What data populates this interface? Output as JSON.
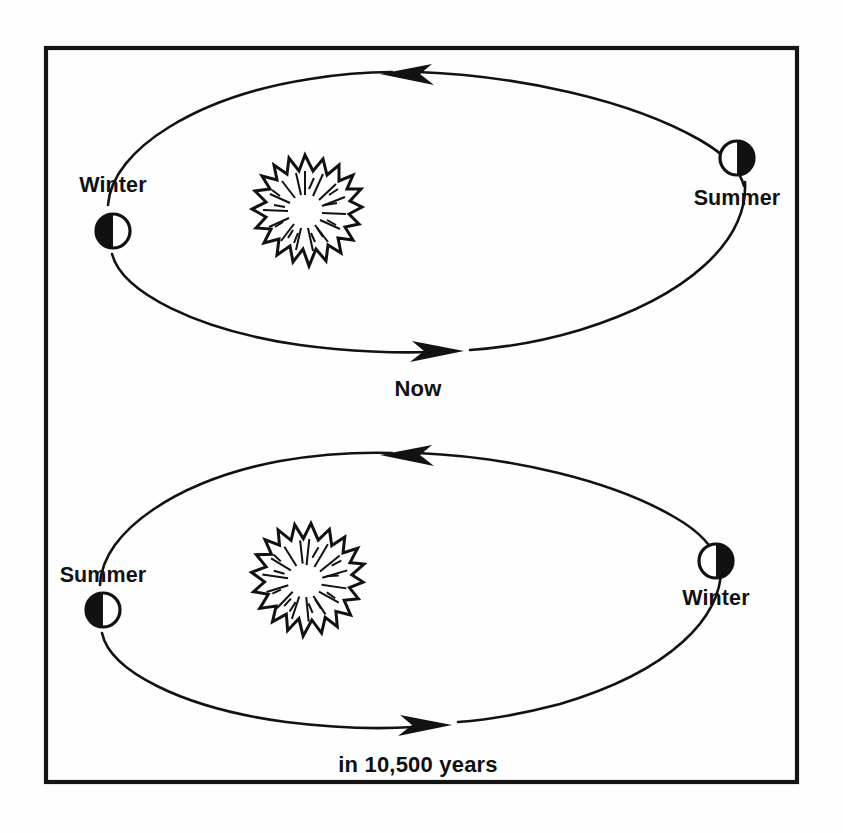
{
  "figure": {
    "background_color": "#fefefe",
    "ink_color": "#111111",
    "frame": {
      "x": 46,
      "y": 48,
      "width": 751,
      "height": 734
    }
  },
  "panels": [
    {
      "id": "now",
      "caption": "Now",
      "caption_x": 418,
      "caption_y": 396,
      "orbit": {
        "cx": 424,
        "cy": 215,
        "rx": 320,
        "ry": 140
      },
      "sun": {
        "cx": 305,
        "cy": 211,
        "r": 56
      },
      "bodies": [
        {
          "label": "Winter",
          "label_x": 113,
          "label_y": 192,
          "label_anchor": "middle",
          "earth_cx": 113,
          "earth_cy": 231,
          "earth_r": 17,
          "dark_side": "left"
        },
        {
          "label": "Summer",
          "label_x": 737,
          "label_y": 205,
          "label_anchor": "middle",
          "earth_cx": 737,
          "earth_cy": 158,
          "earth_r": 17,
          "dark_side": "right"
        }
      ],
      "arrows": [
        {
          "direction": "left",
          "tip_x": 386,
          "tip_y": 73,
          "name": "top-arrow"
        },
        {
          "direction": "right",
          "tip_x": 458,
          "tip_y": 349,
          "name": "bottom-arrow"
        }
      ]
    },
    {
      "id": "future",
      "caption": "in 10,500 years",
      "caption_x": 418,
      "caption_y": 772,
      "orbit": {
        "cx": 410,
        "cy": 591,
        "rx": 310,
        "ry": 140
      },
      "sun": {
        "cx": 305,
        "cy": 580,
        "r": 57
      },
      "bodies": [
        {
          "label": "Summer",
          "label_x": 103,
          "label_y": 582,
          "label_anchor": "middle",
          "earth_cx": 103,
          "earth_cy": 610,
          "earth_r": 17,
          "dark_side": "left"
        },
        {
          "label": "Winter",
          "label_x": 716,
          "label_y": 605,
          "label_anchor": "middle",
          "earth_cx": 716,
          "earth_cy": 561,
          "earth_r": 17,
          "dark_side": "right"
        }
      ],
      "arrows": [
        {
          "direction": "left",
          "tip_x": 386,
          "tip_y": 454,
          "name": "top-arrow"
        },
        {
          "direction": "right",
          "tip_x": 445,
          "tip_y": 722,
          "name": "bottom-arrow"
        }
      ]
    }
  ],
  "labels": {
    "panel1_left": "Winter",
    "panel1_right": "Summer",
    "panel1_caption": "Now",
    "panel2_left": "Summer",
    "panel2_right": "Winter",
    "panel2_caption": "in 10,500 years"
  },
  "icons": {
    "sun": "sun-burst-icon",
    "earth": "earth-half-lit-icon",
    "arrow_left": "arrow-left-icon",
    "arrow_right": "arrow-right-icon"
  }
}
